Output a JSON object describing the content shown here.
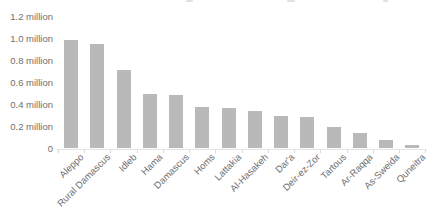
{
  "chart_data": {
    "type": "bar",
    "title": "",
    "xlabel": "",
    "ylabel": "",
    "unit": "million",
    "categories": [
      "Aleppo",
      "Rural Damascus",
      "Idleb",
      "Hama",
      "Damascus",
      "Homs",
      "Lattakia",
      "Al-Hasakeh",
      "Dar'a",
      "Deir-ez-Zor",
      "Tartous",
      "Ar-Raqqa",
      "As-Sweida",
      "Quneitra"
    ],
    "values": [
      0.99,
      0.95,
      0.72,
      0.5,
      0.49,
      0.38,
      0.37,
      0.34,
      0.3,
      0.29,
      0.2,
      0.14,
      0.08,
      0.03
    ],
    "y_ticks": [
      {
        "value": 1.2,
        "label": "1.2 million"
      },
      {
        "value": 1.0,
        "label": "1.0 million"
      },
      {
        "value": 0.8,
        "label": "0.8 million"
      },
      {
        "value": 0.6,
        "label": "0.6 million"
      },
      {
        "value": 0.4,
        "label": "0.4 million"
      },
      {
        "value": 0.2,
        "label": "0.2 million"
      },
      {
        "value": 0.0,
        "label": "0"
      }
    ],
    "ylim": [
      0,
      1.2
    ],
    "grid": false,
    "legend": "none",
    "colors": {
      "bar": "#b9b9b9",
      "axis_text": "#6f6f6f",
      "baseline": "#e3e3e3",
      "category_tick": "#d9d9d9"
    }
  }
}
